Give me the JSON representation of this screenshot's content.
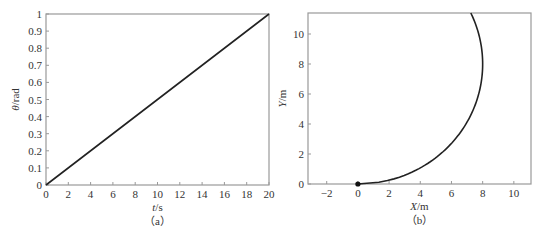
{
  "chart_data": [
    {
      "id": "a",
      "type": "line",
      "caption": "（a）",
      "title": "",
      "xlabel": "t/s",
      "ylabel": "θ/rad",
      "xlim": [
        0,
        20
      ],
      "ylim": [
        0,
        1
      ],
      "xticks": [
        0,
        2,
        4,
        6,
        8,
        10,
        12,
        14,
        16,
        18,
        20
      ],
      "yticks": [
        0,
        0.1,
        0.2,
        0.3,
        0.4,
        0.5,
        0.6,
        0.7,
        0.8,
        0.9,
        1
      ],
      "xtick_labels": [
        "0",
        "2",
        "4",
        "6",
        "8",
        "10",
        "12",
        "14",
        "16",
        "18",
        "20"
      ],
      "ytick_labels": [
        "0",
        "0.1",
        "0.2",
        "0.3",
        "0.4",
        "0.5",
        "0.6",
        "0.7",
        "0.8",
        "0.9",
        "1"
      ],
      "grid": false,
      "series": [
        {
          "name": "theta",
          "x": [
            0,
            5,
            10,
            15,
            20
          ],
          "y": [
            0,
            0.25,
            0.5,
            0.75,
            1.0
          ]
        }
      ]
    },
    {
      "id": "b",
      "type": "line",
      "caption": "（b）",
      "title": "",
      "xlabel": "X/m",
      "ylabel": "Y/m",
      "xlim": [
        -3.2,
        11.1
      ],
      "ylim": [
        0,
        11.4
      ],
      "xticks": [
        -2,
        0,
        2,
        4,
        6,
        8,
        10
      ],
      "yticks": [
        0,
        2,
        4,
        6,
        8,
        10
      ],
      "xtick_labels": [
        "−2",
        "0",
        "2",
        "4",
        "6",
        "8",
        "10"
      ],
      "ytick_labels": [
        "0",
        "2",
        "4",
        "6",
        "8",
        "10"
      ],
      "grid": false,
      "start_marker": {
        "x": 0,
        "y": 0
      },
      "series": [
        {
          "name": "trajectory",
          "x": [
            0,
            1.0,
            2.0,
            3.0,
            4.0,
            5.0,
            6.0,
            7.0,
            7.5,
            7.9,
            8.0,
            7.9,
            7.6,
            7.24
          ],
          "y": [
            0,
            0.06,
            0.25,
            0.58,
            1.07,
            1.76,
            2.71,
            4.13,
            5.21,
            6.74,
            8.0,
            9.26,
            10.5,
            11.4
          ]
        }
      ]
    }
  ]
}
